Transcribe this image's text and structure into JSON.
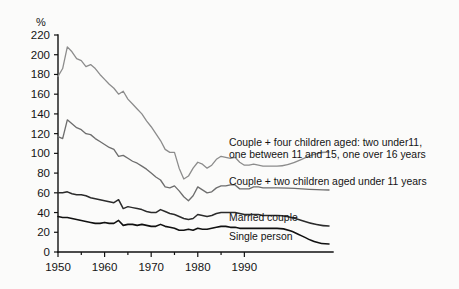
{
  "chart_data": {
    "type": "line",
    "title": "",
    "subtitle": "",
    "xlabel": "",
    "ylabel": "%",
    "unit_label": "%",
    "xlim": [
      1950,
      1994
    ],
    "ylim": [
      0,
      220
    ],
    "grid": false,
    "legend_position": "right-inline",
    "x_ticks_major": [
      1950,
      1960,
      1970,
      1980,
      1990
    ],
    "x_ticks_minor": [
      1955,
      1965,
      1975,
      1985
    ],
    "x_tick_labels": [
      "1950",
      "1960",
      "1970",
      "1980",
      "1990"
    ],
    "y_ticks": [
      0,
      20,
      40,
      60,
      80,
      100,
      120,
      140,
      160,
      180,
      200,
      220
    ],
    "y_tick_labels": [
      "0",
      "20",
      "40",
      "60",
      "80",
      "100",
      "120",
      "140",
      "160",
      "180",
      "200",
      "220"
    ],
    "x": [
      1950,
      1951,
      1952,
      1953,
      1954,
      1955,
      1956,
      1957,
      1958,
      1959,
      1960,
      1961,
      1962,
      1963,
      1964,
      1965,
      1966,
      1967,
      1968,
      1969,
      1970,
      1971,
      1972,
      1973,
      1974,
      1975,
      1976,
      1977,
      1978,
      1979,
      1980,
      1981,
      1982,
      1983,
      1984,
      1985,
      1986,
      1987,
      1988,
      1989,
      1990,
      1991,
      1992,
      1993,
      1994
    ],
    "series": [
      {
        "name": "Couple + four children aged: two under11, one between 11 and 15, one over 16 years",
        "label": "Couple + four children aged: two under11,\none between 11 and 15, one over 16 years",
        "color": "#8c8c8c",
        "stroke_width": 1.3,
        "values": [
          178,
          186,
          208,
          203,
          196,
          194,
          188,
          190,
          186,
          180,
          175,
          170,
          166,
          160,
          163,
          155,
          150,
          145,
          140,
          133,
          127,
          120,
          113,
          104,
          101,
          101,
          85,
          74,
          77,
          85,
          91,
          89,
          85,
          88,
          94,
          97,
          96,
          95,
          96,
          91,
          88,
          88,
          89,
          88,
          87
        ]
      },
      {
        "name": "Couple + two children aged under 11 years",
        "label": "Couple + two children aged under 11 years",
        "color": "#6e6e6e",
        "stroke_width": 1.35,
        "values": [
          117,
          115,
          134,
          130,
          126,
          124,
          120,
          119,
          115,
          112,
          109,
          106,
          104,
          97,
          98,
          95,
          92,
          90,
          87,
          84,
          80,
          76,
          73,
          66,
          65,
          67,
          62,
          56,
          52,
          57,
          66,
          63,
          60,
          61,
          65,
          67,
          67,
          68,
          68,
          64,
          64,
          64,
          66,
          66,
          65
        ]
      },
      {
        "name": "Married couple",
        "label": "Married couple",
        "color": "#2b2b2b",
        "stroke_width": 1.5,
        "values": [
          60,
          60,
          61,
          59,
          58,
          58,
          57,
          55,
          54,
          53,
          52,
          51,
          50,
          53,
          44,
          46,
          45,
          44,
          43,
          41,
          40,
          40,
          43,
          41,
          39,
          38,
          36,
          34,
          33,
          34,
          38,
          37,
          36,
          37,
          39,
          40,
          40,
          40,
          40,
          39,
          38,
          38,
          38,
          38,
          37
        ]
      },
      {
        "name": "Single person",
        "label": "Single person",
        "color": "#111111",
        "stroke_width": 1.6,
        "values": [
          36,
          35,
          35,
          34,
          33,
          32,
          31,
          30,
          29,
          29,
          30,
          29,
          29,
          32,
          27,
          28,
          28,
          27,
          28,
          27,
          26,
          26,
          28,
          26,
          25,
          24,
          22,
          22,
          23,
          22,
          24,
          23,
          23,
          24,
          25,
          26,
          26,
          25,
          25,
          24,
          24,
          24,
          24,
          24,
          24
        ]
      }
    ]
  },
  "legend": {
    "entries": [
      {
        "id": "couple-four-children",
        "line1": "Couple + four children aged: two under11,",
        "line2": "one between 11 and 15, one over 16 years"
      },
      {
        "id": "couple-two-children",
        "line1": "Couple + two children aged under 11 years",
        "line2": ""
      },
      {
        "id": "married-couple",
        "line1": "Married couple",
        "line2": ""
      },
      {
        "id": "single-person",
        "line1": "Single person",
        "line2": ""
      }
    ]
  }
}
